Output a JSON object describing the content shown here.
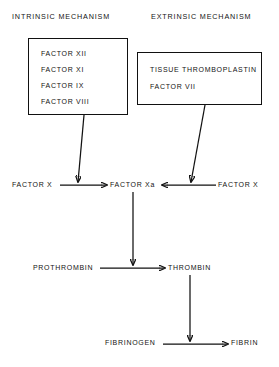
{
  "diagram": {
    "ink_color": "#111111",
    "background_color": "#ffffff",
    "headers": {
      "intrinsic": "INTRINSIC MECHANISM",
      "extrinsic": "EXTRINSIC MECHANISM"
    },
    "intrinsic_box": {
      "lines": [
        "FACTOR  XII",
        "FACTOR  XI",
        "FACTOR  IX",
        "FACTOR  VIII"
      ]
    },
    "extrinsic_box": {
      "lines": [
        "TISSUE  THROMBOPLASTIN",
        "FACTOR  VII"
      ]
    },
    "nodes": {
      "factor_x_left": "FACTOR  X",
      "factor_xa": "FACTOR  Xa",
      "factor_x_right": "FACTOR  X",
      "prothrombin": "PROTHROMBIN",
      "thrombin": "THROMBIN",
      "fibrinogen": "FIBRINOGEN",
      "fibrin": "FIBRIN"
    },
    "edges": [
      {
        "name": "intrinsic-box-to-factor-x-activation",
        "from": "intrinsic_box",
        "to": "factor_x_left_to_xa_line"
      },
      {
        "name": "extrinsic-box-to-factor-x-activation",
        "from": "extrinsic_box",
        "to": "factor_x_right_to_xa_line"
      },
      {
        "name": "factor-x-left-to-factor-xa",
        "from": "factor_x_left",
        "to": "factor_xa"
      },
      {
        "name": "factor-x-right-to-factor-xa",
        "from": "factor_x_right",
        "to": "factor_xa"
      },
      {
        "name": "factor-xa-to-prothrombin-conversion",
        "from": "factor_xa",
        "to": "prothrombin_to_thrombin_line"
      },
      {
        "name": "prothrombin-to-thrombin",
        "from": "prothrombin",
        "to": "thrombin"
      },
      {
        "name": "thrombin-to-fibrinogen-conversion",
        "from": "thrombin",
        "to": "fibrinogen_to_fibrin_line"
      },
      {
        "name": "fibrinogen-to-fibrin",
        "from": "fibrinogen",
        "to": "fibrin"
      }
    ]
  }
}
